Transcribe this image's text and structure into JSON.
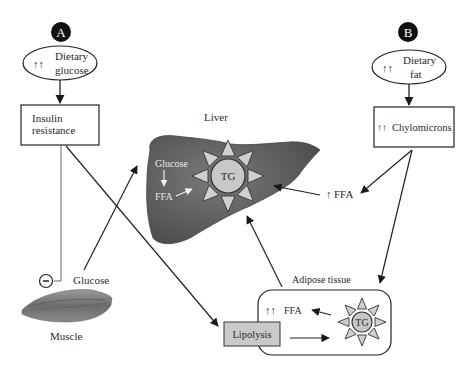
{
  "panels": {
    "a": {
      "badge": "A",
      "source": {
        "arrows": "↑↑",
        "line1": "Dietary",
        "line2": "glucose"
      },
      "box": {
        "line1": "Insulin",
        "line2": "resistance"
      }
    },
    "b": {
      "badge": "B",
      "source": {
        "arrows": "↑↑",
        "line1": "Dietary",
        "line2": "fat"
      },
      "box": {
        "arrows": "↑↑",
        "label": "Chylomicrons"
      }
    }
  },
  "liver": {
    "title": "Liver",
    "glucose": "Glucose",
    "ffa": "FFA",
    "tg": "TG"
  },
  "plasma_ffa": {
    "arrows": "↑",
    "label": "FFA"
  },
  "muscle": {
    "label": "Muscle",
    "glucose": "Glucose",
    "inhibit_symbol": "−"
  },
  "adipose": {
    "title": "Adipose tissue",
    "ffa_arrows": "↑↑",
    "ffa": "FFA",
    "tg": "TG",
    "lipolysis": "Lipolysis"
  },
  "colors": {
    "liver": "#5b5b5b",
    "tg_fill": "#c8c8c8",
    "spike_fill": "#cfcfcf",
    "lipolysis_fill": "#c9c9c9",
    "badge": "#111111",
    "line": "#222222"
  }
}
